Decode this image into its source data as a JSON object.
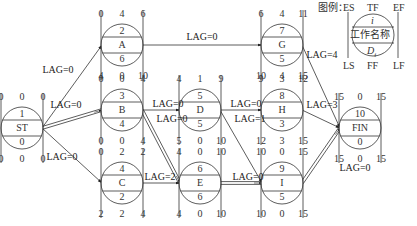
{
  "legend": {
    "title": "图例：",
    "top": [
      "ES",
      "TF",
      "EF"
    ],
    "bottom": [
      "LS",
      "FF",
      "LF"
    ],
    "row1": "i",
    "row2": "工作名称",
    "row3": "D",
    "row3_sub": "i"
  },
  "nodes": [
    {
      "id": "ST",
      "num": "1",
      "name": "ST",
      "dur": "0",
      "ES": "0",
      "TF": "0",
      "EF": "0",
      "LS": "0",
      "FF": "0",
      "LF": "0",
      "x": 22,
      "y": 128
    },
    {
      "id": "A",
      "num": "2",
      "name": "A",
      "dur": "6",
      "ES": "0",
      "TF": "4",
      "EF": "6",
      "LS": "4",
      "FF": "0",
      "LF": "10",
      "x": 122,
      "y": 45
    },
    {
      "id": "B",
      "num": "3",
      "name": "B",
      "dur": "4",
      "ES": "0",
      "TF": "0",
      "EF": "4",
      "LS": "0",
      "FF": "0",
      "LF": "4",
      "x": 122,
      "y": 110
    },
    {
      "id": "C",
      "num": "4",
      "name": "C",
      "dur": "2",
      "ES": "0",
      "TF": "2",
      "EF": "2",
      "LS": "2",
      "FF": "2",
      "LF": "4",
      "x": 122,
      "y": 183
    },
    {
      "id": "D",
      "num": "5",
      "name": "D",
      "dur": "5",
      "ES": "4",
      "TF": "1",
      "EF": "9",
      "LS": "5",
      "FF": "0",
      "LF": "10",
      "x": 200,
      "y": 110
    },
    {
      "id": "E",
      "num": "6",
      "name": "E",
      "dur": "6",
      "ES": "4",
      "TF": "0",
      "EF": "10",
      "LS": "4",
      "FF": "0",
      "LF": "10",
      "x": 200,
      "y": 183
    },
    {
      "id": "G",
      "num": "7",
      "name": "G",
      "dur": "5",
      "ES": "6",
      "TF": "4",
      "EF": "11",
      "LS": "10",
      "FF": "4",
      "LF": "15",
      "x": 282,
      "y": 45
    },
    {
      "id": "H",
      "num": "8",
      "name": "H",
      "dur": "3",
      "ES": "9",
      "TF": "3",
      "EF": "12",
      "LS": "12",
      "FF": "3",
      "LF": "15",
      "x": 282,
      "y": 110
    },
    {
      "id": "I",
      "num": "9",
      "name": "I",
      "dur": "5",
      "ES": "10",
      "TF": "0",
      "EF": "15",
      "LS": "10",
      "FF": "0",
      "LF": "15",
      "x": 282,
      "y": 183
    },
    {
      "id": "FIN",
      "num": "10",
      "name": "FIN",
      "dur": "0",
      "ES": "15",
      "TF": "0",
      "EF": "15",
      "LS": "15",
      "FF": "0",
      "LF": "15",
      "x": 360,
      "y": 128
    }
  ],
  "edges": [
    {
      "from": "ST",
      "to": "A",
      "lag": "LAG=0",
      "critical": false,
      "lx": 58,
      "ly": 70
    },
    {
      "from": "ST",
      "to": "B",
      "lag": "LAG=0",
      "critical": true,
      "lx": 66,
      "ly": 105
    },
    {
      "from": "ST",
      "to": "C",
      "lag": "LAG=0",
      "critical": false,
      "lx": 62,
      "ly": 157
    },
    {
      "from": "A",
      "to": "G",
      "lag": "LAG=0",
      "critical": false,
      "lx": 202,
      "ly": 37
    },
    {
      "from": "B",
      "to": "D",
      "lag": "LAG=0",
      "critical": false,
      "lx": 168,
      "ly": 104
    },
    {
      "from": "B",
      "to": "E",
      "lag": "LAG=0",
      "critical": true,
      "lx": 172,
      "ly": 119
    },
    {
      "from": "C",
      "to": "E",
      "lag": "LAG=2",
      "critical": false,
      "lx": 160,
      "ly": 177
    },
    {
      "from": "D",
      "to": "H",
      "lag": "LAG=0",
      "critical": false,
      "lx": 246,
      "ly": 104
    },
    {
      "from": "D",
      "to": "I",
      "lag": "LAG=1",
      "critical": false,
      "lx": 250,
      "ly": 119
    },
    {
      "from": "E",
      "to": "I",
      "lag": "LAG=0",
      "critical": true,
      "lx": 248,
      "ly": 177
    },
    {
      "from": "G",
      "to": "FIN",
      "lag": "LAG=4",
      "critical": false,
      "lx": 322,
      "ly": 55
    },
    {
      "from": "H",
      "to": "FIN",
      "lag": "LAG=3",
      "critical": false,
      "lx": 322,
      "ly": 105
    },
    {
      "from": "I",
      "to": "FIN",
      "lag": "LAG=0",
      "critical": true,
      "lx": 355,
      "ly": 168
    }
  ]
}
